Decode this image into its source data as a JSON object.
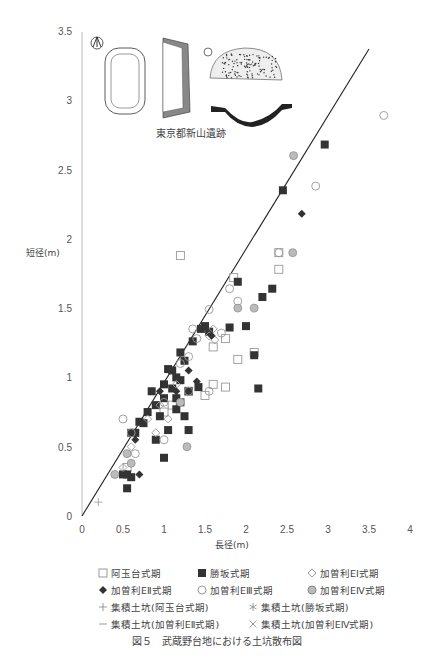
{
  "chart_data": {
    "type": "scatter",
    "xlabel": "長径(m)",
    "ylabel": "短径(m)",
    "xlim": [
      0,
      4
    ],
    "ylim": [
      0,
      3.5
    ],
    "x_ticks": [
      "0",
      "0.5",
      "1",
      "1.5",
      "2",
      "2.5",
      "3",
      "3.5",
      "4"
    ],
    "y_ticks": [
      "0",
      "0.5",
      "1",
      "1.5",
      "2",
      "2.5",
      "3",
      "3.5"
    ],
    "grid": false,
    "legend_position": "bottom",
    "inset_caption": "東京都新山遺跡",
    "regression_line": {
      "x": [
        0,
        3.5
      ],
      "y": [
        0,
        3.37
      ]
    },
    "series": [
      {
        "name": "阿玉台式期",
        "marker": "open-square",
        "points": [
          [
            1.2,
            1.88
          ],
          [
            2.4,
            1.78
          ],
          [
            2.4,
            1.9
          ],
          [
            1.85,
            1.72
          ],
          [
            1.6,
            1.22
          ],
          [
            2.1,
            1.18
          ],
          [
            1.9,
            1.13
          ],
          [
            1.75,
            0.93
          ],
          [
            1.3,
            0.9
          ],
          [
            1.5,
            0.87
          ],
          [
            1.6,
            0.95
          ],
          [
            1.1,
            0.8
          ],
          [
            0.55,
            0.35
          ],
          [
            1.0,
            0.75
          ],
          [
            1.75,
            1.28
          ]
        ]
      },
      {
        "name": "勝坂式期",
        "marker": "filled-square",
        "points": [
          [
            2.96,
            2.68
          ],
          [
            2.45,
            2.35
          ],
          [
            1.9,
            1.69
          ],
          [
            2.32,
            1.64
          ],
          [
            2.2,
            1.58
          ],
          [
            2.0,
            1.37
          ],
          [
            1.5,
            1.37
          ],
          [
            1.45,
            1.35
          ],
          [
            1.55,
            1.33
          ],
          [
            1.8,
            1.36
          ],
          [
            1.35,
            1.26
          ],
          [
            2.1,
            1.16
          ],
          [
            1.2,
            1.18
          ],
          [
            1.25,
            1.12
          ],
          [
            1.05,
            1.06
          ],
          [
            1.15,
            1.0
          ],
          [
            1.0,
            0.95
          ],
          [
            1.1,
            0.92
          ],
          [
            1.3,
            0.9
          ],
          [
            1.42,
            0.93
          ],
          [
            1.2,
            0.82
          ],
          [
            1.15,
            0.77
          ],
          [
            1.25,
            0.72
          ],
          [
            2.15,
            0.92
          ],
          [
            1.05,
            0.62
          ],
          [
            1.3,
            0.62
          ],
          [
            0.9,
            0.55
          ],
          [
            0.7,
            0.68
          ],
          [
            0.75,
            0.67
          ],
          [
            1.0,
            0.42
          ],
          [
            0.55,
            0.3
          ],
          [
            0.5,
            0.3
          ],
          [
            0.6,
            0.28
          ],
          [
            0.55,
            0.2
          ],
          [
            0.85,
            0.9
          ],
          [
            0.9,
            0.8
          ],
          [
            1.0,
            0.85
          ],
          [
            0.65,
            0.6
          ],
          [
            0.8,
            0.75
          ],
          [
            0.95,
            0.72
          ],
          [
            1.1,
            1.05
          ],
          [
            1.2,
            0.98
          ],
          [
            0.6,
            0.6
          ],
          [
            1.15,
            0.85
          ]
        ]
      },
      {
        "name": "加曽利EⅠ式期",
        "marker": "open-diamond",
        "points": [
          [
            1.62,
            1.27
          ],
          [
            1.55,
            1.3
          ],
          [
            1.15,
            0.95
          ],
          [
            0.95,
            0.8
          ],
          [
            0.8,
            0.7
          ],
          [
            0.6,
            0.5
          ],
          [
            0.5,
            0.35
          ],
          [
            1.6,
            1.35
          ],
          [
            0.9,
            0.6
          ],
          [
            1.05,
            0.7
          ]
        ]
      },
      {
        "name": "加曽利EⅡ式期",
        "marker": "filled-diamond",
        "points": [
          [
            2.68,
            2.18
          ],
          [
            1.58,
            1.3
          ],
          [
            1.4,
            0.97
          ],
          [
            1.15,
            0.9
          ],
          [
            0.65,
            0.55
          ],
          [
            0.7,
            0.3
          ],
          [
            1.3,
            1.05
          ],
          [
            0.95,
            0.9
          ]
        ]
      },
      {
        "name": "加曽利EⅢ式期",
        "marker": "open-circle",
        "points": [
          [
            3.68,
            2.89
          ],
          [
            2.85,
            2.38
          ],
          [
            2.4,
            1.9
          ],
          [
            1.4,
            1.28
          ],
          [
            1.8,
            1.64
          ],
          [
            1.55,
            1.49
          ],
          [
            1.9,
            1.55
          ],
          [
            1.35,
            1.35
          ],
          [
            1.3,
            1.15
          ],
          [
            1.2,
            1.1
          ],
          [
            0.5,
            0.7
          ],
          [
            0.65,
            0.45
          ],
          [
            1.7,
            1.32
          ],
          [
            1.3,
            0.9
          ],
          [
            0.6,
            0.6
          ],
          [
            1.0,
            0.55
          ],
          [
            1.55,
            0.9
          ],
          [
            1.0,
            0.82
          ]
        ]
      },
      {
        "name": "加曽利EⅣ式期",
        "marker": "grey-circle",
        "points": [
          [
            2.58,
            2.6
          ],
          [
            2.57,
            1.9
          ],
          [
            1.9,
            1.5
          ],
          [
            2.1,
            1.5
          ],
          [
            1.28,
            0.5
          ],
          [
            0.55,
            0.45
          ],
          [
            0.6,
            0.38
          ],
          [
            0.4,
            0.3
          ],
          [
            1.2,
            0.82
          ]
        ]
      },
      {
        "name": "集積土坑(阿玉台式期)",
        "marker": "plus",
        "points": [
          [
            0.2,
            0.1
          ]
        ]
      },
      {
        "name": "集積土坑(勝坂式期)",
        "marker": "asterisk",
        "points": []
      },
      {
        "name": "集積土坑(加曽利EⅡ式期)",
        "marker": "dash",
        "points": []
      },
      {
        "name": "集積土坑(加曽利EⅣ式期)",
        "marker": "cross",
        "points": []
      }
    ]
  },
  "legend": {
    "items": [
      {
        "label": "阿玉台式期",
        "icon": "open-square-icon"
      },
      {
        "label": "勝坂式期",
        "icon": "filled-square-icon"
      },
      {
        "label": "加曽利EⅠ式期",
        "icon": "open-diamond-icon"
      },
      {
        "label": "加曽利EⅡ式期",
        "icon": "filled-diamond-icon"
      },
      {
        "label": "加曽利EⅢ式期",
        "icon": "open-circle-icon"
      },
      {
        "label": "加曽利EⅣ式期",
        "icon": "grey-circle-icon"
      },
      {
        "label": "集積土坑(阿玉台式期)",
        "icon": "plus-icon"
      },
      {
        "label": "集積土坑(勝坂式期)",
        "icon": "asterisk-icon"
      },
      {
        "label": "集積土坑(加曽利EⅡ式期)",
        "icon": "dash-icon"
      },
      {
        "label": "集積土坑(加曽利EⅣ式期)",
        "icon": "cross-icon"
      }
    ]
  },
  "caption": {
    "fig": "図５",
    "text": "武蔵野台地における土坑散布図"
  },
  "colors": {
    "filled": "#333333",
    "open_stroke": "#999999",
    "grey_fill": "#bbbbbb",
    "axis": "#aaaaaa",
    "line": "#222222"
  }
}
